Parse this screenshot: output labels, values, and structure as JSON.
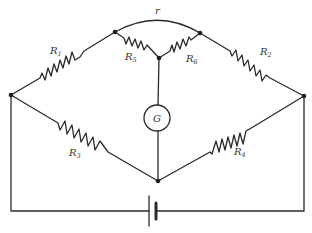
{
  "diagram": {
    "type": "circuit",
    "colors": {
      "line": "#2a2a2a",
      "node": "#1e1e1e",
      "text": "#333333",
      "background": "#ffffff"
    },
    "labels": {
      "R1": {
        "main": "R",
        "sub": "1"
      },
      "R2": {
        "main": "R",
        "sub": "2"
      },
      "R3": {
        "main": "R",
        "sub": "3"
      },
      "R4": {
        "main": "R",
        "sub": "4"
      },
      "R5": {
        "main": "R",
        "sub": "5"
      },
      "R6": {
        "main": "R",
        "sub": "6"
      },
      "r": "r",
      "G": "G"
    },
    "components": [
      {
        "id": "R1",
        "type": "resistor",
        "from": "left-node",
        "to": "top-left-node"
      },
      {
        "id": "R2",
        "type": "resistor",
        "from": "top-right-node",
        "to": "right-node"
      },
      {
        "id": "R3",
        "type": "resistor",
        "from": "left-node",
        "to": "bottom-node"
      },
      {
        "id": "R4",
        "type": "resistor",
        "from": "bottom-node",
        "to": "right-node"
      },
      {
        "id": "R5",
        "type": "resistor",
        "from": "top-left-node",
        "to": "center-node"
      },
      {
        "id": "R6",
        "type": "resistor",
        "from": "center-node",
        "to": "top-right-node"
      },
      {
        "id": "r",
        "type": "arc-wire",
        "from": "top-left-node",
        "to": "top-right-node"
      },
      {
        "id": "G",
        "type": "galvanometer",
        "from": "center-node",
        "to": "bottom-node"
      },
      {
        "id": "battery",
        "type": "cell",
        "from": "left-node",
        "to": "right-node"
      }
    ]
  }
}
